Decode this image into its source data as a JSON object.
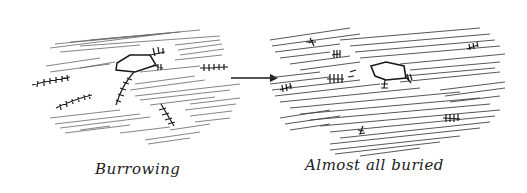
{
  "panels": [
    {
      "id": "left",
      "caption": "Burrowing"
    },
    {
      "id": "right",
      "caption": "Almost all buried"
    }
  ],
  "arrow": {
    "direction": "right",
    "meaning": "transition"
  },
  "colors": {
    "ink": "#1a1a1a",
    "hatch": "#555555",
    "background": "#ffffff"
  }
}
